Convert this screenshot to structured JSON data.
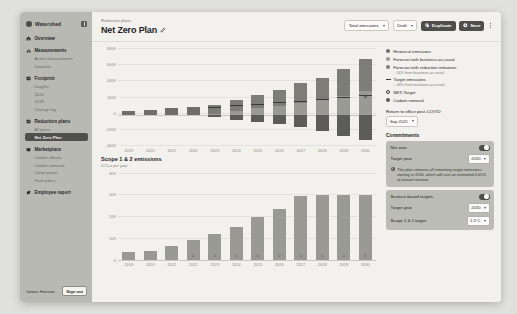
{
  "sidebar": {
    "brand": "Watershed",
    "collapse_icon": "collapse-panel-icon",
    "groups": [
      {
        "label": "Overview",
        "icon": "home-icon",
        "items": []
      },
      {
        "label": "Measurements",
        "icon": "bar-chart-icon",
        "items": [
          "Active measurement",
          "Datasets"
        ]
      },
      {
        "label": "Footprint",
        "icon": "footprint-icon",
        "items": [
          "Insights",
          "2020",
          "2019",
          "Change log"
        ]
      },
      {
        "label": "Reduction plans",
        "icon": "plans-icon",
        "items": [
          "All plans",
          "Net Zero Plan"
        ]
      },
      {
        "label": "Marketplace",
        "icon": "marketplace-icon",
        "items": [
          "Carbon offsets",
          "Carbon removal",
          "Clean power",
          "Fuel orders"
        ]
      },
      {
        "label": "Employee report",
        "icon": "leaf-icon",
        "items": []
      }
    ],
    "active_item": "Net Zero Plan",
    "user": "James Hansen",
    "sign_out": "Sign out"
  },
  "header": {
    "breadcrumb": "Reduction plans",
    "title": "Net Zero Plan",
    "edit_icon": "pencil-icon",
    "scope_select": "Total emissions",
    "status_select": "Draft",
    "duplicate_label": "Duplicate",
    "duplicate_icon": "copy-icon",
    "save_label": "Save",
    "save_icon": "save-icon",
    "more_icon": "kebab-menu-icon"
  },
  "legend": {
    "items": [
      {
        "label": "Historical emissions",
        "marker": "dot",
        "color": "#6f6f6a",
        "note": ""
      },
      {
        "label": "Forecast with business-as-usual",
        "marker": "dot",
        "color": "#9a9a94",
        "note": ""
      },
      {
        "label": "Forecast with reduction initiatives",
        "marker": "dot",
        "color": "#7d7d78",
        "note": "↓ 14% from business-as-usual"
      },
      {
        "label": "Target emissions",
        "marker": "dash",
        "color": "#3a3a37",
        "note": "↓ 46% from business-as-usual"
      },
      {
        "label": "SBTi Target",
        "marker": "ring",
        "color": "#3c3c39",
        "note": ""
      },
      {
        "label": "Carbon removal",
        "marker": "dot",
        "color": "#5c5c58",
        "note": ""
      }
    ]
  },
  "rail": {
    "return_label": "Return to office post-COVID",
    "return_value": "Sep 2021",
    "commitments_title": "Commitments",
    "net_zero": {
      "title": "Net zero",
      "toggle_on": true,
      "target_year_label": "Target year",
      "target_year_value": "2030",
      "info_icon": "info-icon",
      "info_text": "This plan removes all remaining target emissions starting in 2030, which will cost an estimated 0.65% of annual revenue."
    },
    "sbt": {
      "title": "Science-based targets",
      "toggle_on": true,
      "target_year_label": "Target year",
      "target_year_value": "2030",
      "scope_label": "Scope 1 & 2 target",
      "scope_value": "1.5°C"
    }
  },
  "section2": {
    "title": "Scope 1 & 2 emissions",
    "subtitle": "tCO₂e per year"
  },
  "chart_data": [
    {
      "type": "bar",
      "title": "Total emissions",
      "xlabel": "",
      "ylabel": "",
      "categories": [
        "2019",
        "2020",
        "2021",
        "2022",
        "2023",
        "2024",
        "2025",
        "2026",
        "2027",
        "2028",
        "2029",
        "2030"
      ],
      "yticks": [
        "800K",
        "600K",
        "400K",
        "200K",
        "0",
        "-200K",
        "-400K"
      ],
      "ylim": [
        -400000,
        900000
      ],
      "grid": true,
      "legend": "right",
      "series": [
        {
          "name": "Historical emissions",
          "color": "#6f6f6a",
          "values": [
            60000,
            70000,
            95000,
            110000,
            0,
            0,
            0,
            0,
            0,
            0,
            0,
            0
          ]
        },
        {
          "name": "Forecast with business-as-usual",
          "color": "#9a9a94",
          "values": [
            0,
            0,
            0,
            0,
            20000,
            55000,
            90000,
            120000,
            165000,
            200000,
            260000,
            320000
          ]
        },
        {
          "name": "Forecast with reduction initiatives",
          "color": "#7d7d78",
          "values": [
            0,
            0,
            0,
            0,
            120000,
            150000,
            185000,
            220000,
            270000,
            300000,
            360000,
            430000
          ]
        },
        {
          "name": "Carbon removal",
          "color": "#5c5c58",
          "values": [
            0,
            0,
            0,
            0,
            -30000,
            -60000,
            -90000,
            -120000,
            -160000,
            -210000,
            -280000,
            -330000
          ]
        }
      ],
      "target_line": {
        "name": "Target emissions",
        "color": "#3a3a37",
        "values": [
          null,
          null,
          null,
          null,
          110000,
          130000,
          150000,
          170000,
          190000,
          215000,
          240000,
          265000
        ]
      },
      "sbti_points": {
        "name": "SBTi Target",
        "color": "#3c3c39",
        "values": [
          null,
          null,
          null,
          null,
          null,
          null,
          null,
          null,
          null,
          null,
          null,
          255000
        ]
      }
    },
    {
      "type": "bar",
      "title": "Scope 1 & 2 emissions",
      "subtitle": "tCO₂e per year",
      "xlabel": "",
      "ylabel": "",
      "categories": [
        "2019",
        "2020",
        "2021",
        "2022",
        "2023",
        "2024",
        "2025",
        "2026",
        "2027",
        "2028",
        "2029",
        "2030"
      ],
      "yticks": [
        "40K",
        "30K",
        "20K",
        "10K",
        "0"
      ],
      "ylim": [
        0,
        45000
      ],
      "grid": true,
      "values": [
        4000,
        4500,
        7000,
        10000,
        13000,
        17000,
        22000,
        26000,
        33000,
        33500,
        33500,
        33500
      ],
      "bar_labels": [
        "",
        "",
        "",
        "0",
        "0",
        "0",
        "0",
        "0",
        "0",
        "0",
        "0",
        "0"
      ]
    }
  ]
}
